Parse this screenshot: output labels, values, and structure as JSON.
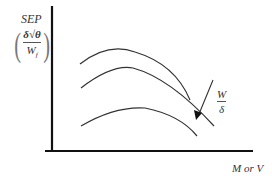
{
  "diagram": {
    "y_axis": {
      "label_top": "SEP",
      "fraction_numerator": "δ√θ",
      "fraction_denominator": "W",
      "fraction_denominator_subscript": "f"
    },
    "x_axis": {
      "label": "M or V"
    },
    "arrow_label": {
      "numerator": "W",
      "denominator": "δ"
    },
    "curves": [
      {
        "name": "upper-curve",
        "path": "M80,64 Q108,42 135,52 Q175,64 190,100"
      },
      {
        "name": "middle-curve",
        "path": "M81,88 Q110,66 132,68 Q170,78 214,126"
      },
      {
        "name": "lower-curve",
        "path": "M81,126 Q115,106 145,108 Q180,115 196,136"
      }
    ],
    "colors": {
      "axis": "#111111",
      "curve": "#333333",
      "text": "#333333"
    }
  }
}
